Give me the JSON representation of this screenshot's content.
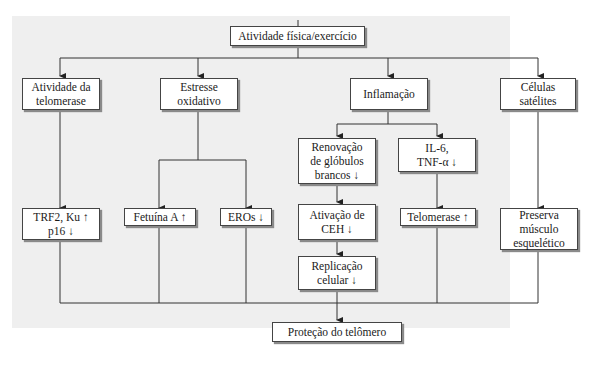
{
  "diagram": {
    "root": "Atividade física/exercício",
    "level1": [
      "Atividade da\ntelomerase",
      "Estresse\noxidativo",
      "Inflamação",
      "Células\nsatélites"
    ],
    "inflammation_children": [
      "Renovação\nde glóbulos\nbrancos ↓",
      "IL-6,\nTNF-α ↓"
    ],
    "effects": {
      "telomerase_activity": "TRF2, Ku ↑\np16 ↓",
      "fetuin": "Fetuína A ↑",
      "ros": "EROs ↓",
      "ceh_activation": "Ativação de\nCEH ↓",
      "telomerase_up": "Telomerase ↑",
      "cell_replication": "Replicação\ncelular ↓",
      "skeletal_muscle": "Preserva\nmúsculo\nesquelético"
    },
    "outcome": "Proteção do telômero"
  }
}
